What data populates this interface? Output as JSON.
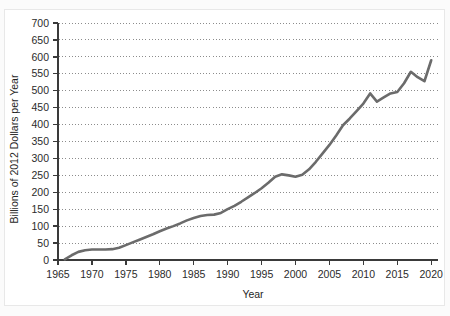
{
  "figure": {
    "top_caption_fragment": "",
    "background_color": "#fbfbfb",
    "card_background": "#ffffff",
    "card_border_color": "#e8e8e8"
  },
  "chart_data": {
    "type": "line",
    "title": "",
    "xlabel": "Year",
    "ylabel": "Billions of 2012 Dollars per Year",
    "xlim": [
      1965,
      2021
    ],
    "ylim": [
      0,
      700
    ],
    "xticks": [
      1965,
      1970,
      1975,
      1980,
      1985,
      1990,
      1995,
      2000,
      2005,
      2010,
      2015,
      2020
    ],
    "yticks": [
      0,
      50,
      100,
      150,
      200,
      250,
      300,
      350,
      400,
      450,
      500,
      550,
      600,
      650,
      700
    ],
    "grid": true,
    "grid_style": "dotted",
    "grid_color": "#8c8c8c",
    "legend": "none",
    "line_color": "#6b6b6b",
    "line_width": 2.6,
    "axis_color": "#3a3a3a",
    "series": [
      {
        "name": "Spending",
        "x": [
          1966,
          1967,
          1968,
          1969,
          1970,
          1971,
          1972,
          1973,
          1974,
          1975,
          1976,
          1977,
          1978,
          1979,
          1980,
          1981,
          1982,
          1983,
          1984,
          1985,
          1986,
          1987,
          1988,
          1989,
          1990,
          1991,
          1992,
          1993,
          1994,
          1995,
          1996,
          1997,
          1998,
          1999,
          2000,
          2001,
          2002,
          2003,
          2004,
          2005,
          2006,
          2007,
          2008,
          2009,
          2010,
          2011,
          2012,
          2013,
          2014,
          2015,
          2016,
          2017,
          2018,
          2019,
          2020
        ],
        "values": [
          2,
          14,
          24,
          29,
          31,
          31,
          31,
          32,
          36,
          44,
          52,
          60,
          68,
          76,
          85,
          93,
          100,
          108,
          117,
          124,
          130,
          133,
          134,
          139,
          150,
          160,
          172,
          185,
          198,
          212,
          228,
          246,
          253,
          250,
          246,
          252,
          268,
          290,
          315,
          340,
          368,
          398,
          418,
          440,
          462,
          492,
          468,
          480,
          492,
          496,
          522,
          556,
          540,
          528,
          590
        ]
      }
    ]
  },
  "axis_labels": {
    "y_title": "Billions of 2012 Dollars per Year",
    "x_title": "Year"
  }
}
